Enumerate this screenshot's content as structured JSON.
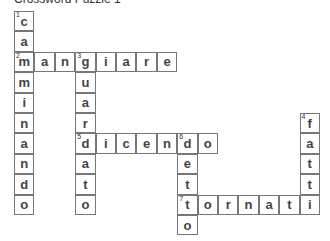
{
  "title": "Crossword Puzzle 1",
  "grid": {
    "cell_size": 20.4,
    "origin_x": 14,
    "origin_y": 11
  },
  "words": [
    {
      "number": "1",
      "direction": "down",
      "answer": "camminando",
      "row": 0,
      "col": 0
    },
    {
      "number": "2",
      "direction": "across",
      "answer": "mangiare",
      "row": 2,
      "col": 0
    },
    {
      "number": "3",
      "direction": "down",
      "answer": "guardato",
      "row": 2,
      "col": 3
    },
    {
      "number": "4",
      "direction": "down",
      "answer": "fatti",
      "row": 5,
      "col": 14
    },
    {
      "number": "5",
      "direction": "across",
      "answer": "dicendo",
      "row": 6,
      "col": 3
    },
    {
      "number": "6",
      "direction": "down",
      "answer": "detto",
      "row": 6,
      "col": 8
    },
    {
      "number": "7",
      "direction": "across",
      "answer": "tornati",
      "row": 9,
      "col": 8
    }
  ]
}
